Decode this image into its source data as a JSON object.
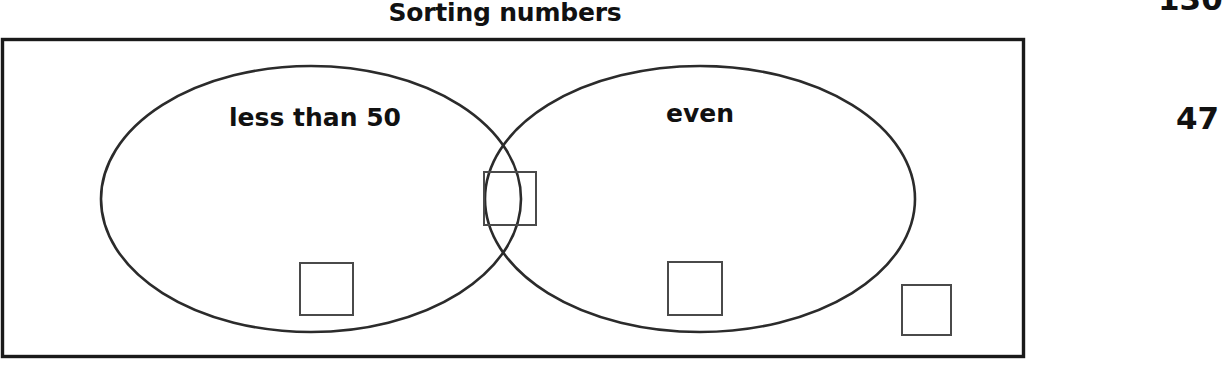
{
  "worksheet": {
    "title": "Sorting numbers"
  },
  "margin_numbers": [
    {
      "value": "130",
      "clipped": true
    },
    {
      "value": "47",
      "clipped": false
    }
  ],
  "venn": {
    "universe_label": "",
    "sets": [
      {
        "id": "left",
        "label": "less than 50"
      },
      {
        "id": "right",
        "label": "even"
      }
    ],
    "answer_boxes": [
      {
        "region": "intersection",
        "value": ""
      },
      {
        "region": "left-only",
        "value": ""
      },
      {
        "region": "right-only",
        "value": ""
      },
      {
        "region": "outside",
        "value": ""
      }
    ]
  },
  "colors": {
    "ink": "#111111",
    "outline": "#2b2b2b",
    "box_outline": "#4a4a4a",
    "paper": "#ffffff"
  }
}
